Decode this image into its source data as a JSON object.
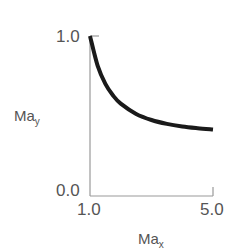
{
  "chart_data": {
    "type": "line",
    "title": "",
    "xlabel": "Ma_x",
    "ylabel": "Ma_y",
    "xlabel_main": "Ma",
    "xlabel_sub": "x",
    "ylabel_main": "Ma",
    "ylabel_sub": "y",
    "xlim": [
      1.0,
      5.0
    ],
    "ylim": [
      0.0,
      1.0
    ],
    "x_ticks": [
      "1.0",
      "5.0"
    ],
    "y_ticks": [
      "0.0",
      "1.0"
    ],
    "grid": false,
    "legend": null,
    "series": [
      {
        "name": "Ma_y",
        "color": "#1a1a1a",
        "x": [
          1.0,
          1.25,
          1.5,
          1.75,
          2.0,
          2.5,
          3.0,
          3.5,
          4.0,
          4.5,
          5.0
        ],
        "y": [
          1.0,
          0.813,
          0.701,
          0.628,
          0.577,
          0.513,
          0.475,
          0.451,
          0.435,
          0.424,
          0.415
        ]
      }
    ]
  },
  "labels": {
    "y_top": "1.0",
    "y_bottom": "0.0",
    "x_left": "1.0",
    "x_right": "5.0"
  }
}
